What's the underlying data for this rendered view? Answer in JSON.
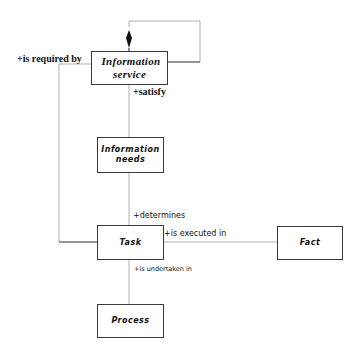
{
  "diagram": {
    "type": "UML class diagram",
    "line_color": "#b0b0b0",
    "box_border_color": "#3a3a3a",
    "classes": [
      {
        "id": "information_service",
        "label": "Information service"
      },
      {
        "id": "information_needs",
        "label": "Information needs"
      },
      {
        "id": "task",
        "label": "Task"
      },
      {
        "id": "fact",
        "label": "Fact"
      },
      {
        "id": "process",
        "label": "Process"
      }
    ],
    "associations": [
      {
        "from": "information_service",
        "to": "information_service",
        "kind": "composition",
        "label": ""
      },
      {
        "from": "information_service",
        "to": "task",
        "label": "+is required by"
      },
      {
        "from": "information_service",
        "to": "information_needs",
        "label": "+satisfy"
      },
      {
        "from": "information_needs",
        "to": "task",
        "label": "+determines"
      },
      {
        "from": "task",
        "to": "fact",
        "label": "+is executed in"
      },
      {
        "from": "task",
        "to": "process",
        "label": "+is undertaken in"
      }
    ]
  },
  "labels": {
    "is_required_by": "+is required by",
    "satisfy": "+satisfy",
    "determines": "+determines",
    "is_executed_in": "+is executed in",
    "is_undertaken_in": "+is undertaken in"
  },
  "boxes": {
    "information_service": "Information service",
    "information_needs": "Information needs",
    "task": "Task",
    "fact": "Fact",
    "process": "Process"
  }
}
